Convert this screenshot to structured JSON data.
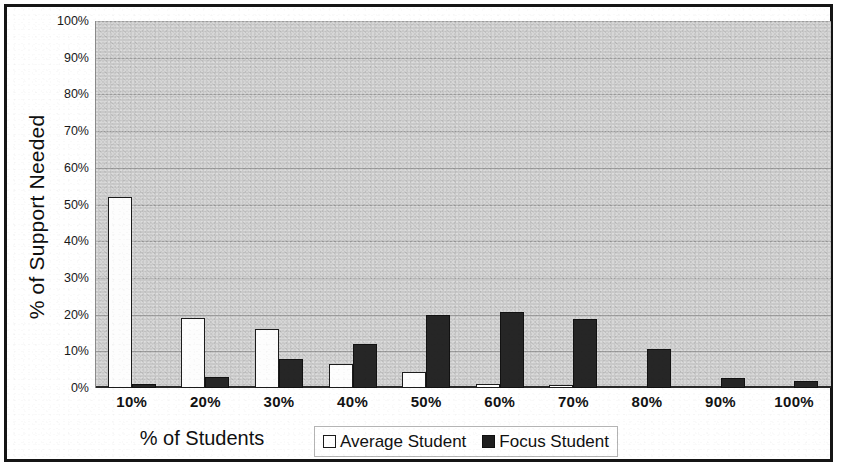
{
  "chart_data": {
    "type": "bar",
    "title": "",
    "xlabel": "% of Students",
    "ylabel": "% of Support Needed",
    "categories": [
      "10%",
      "20%",
      "30%",
      "40%",
      "50%",
      "60%",
      "70%",
      "80%",
      "90%",
      "100%"
    ],
    "series": [
      {
        "name": "Average Student",
        "color": "#ffffff",
        "values": [
          52,
          19,
          16,
          6.5,
          4.5,
          1,
          0.7,
          0,
          0,
          0
        ]
      },
      {
        "name": "Focus Student",
        "color": "#202020",
        "values": [
          1.2,
          3,
          7.8,
          12,
          19.8,
          20.7,
          18.8,
          10.5,
          2.8,
          1.8
        ]
      }
    ],
    "ylim": [
      0,
      100
    ],
    "ytick_labels": [
      "100%",
      "90%",
      "80%",
      "70%",
      "60%",
      "50%",
      "40%",
      "30%",
      "20%",
      "10%",
      "0%"
    ],
    "ytick_values": [
      100,
      90,
      80,
      70,
      60,
      50,
      40,
      30,
      20,
      10,
      0
    ],
    "grid": true,
    "legend_position": "bottom-center",
    "plot_background_color": "#c9c9c9",
    "frame_color": "#151515"
  },
  "legend": {
    "items": [
      {
        "label": "Average Student",
        "swatch": "hollow-square"
      },
      {
        "label": "Focus Student",
        "swatch": "filled-square"
      }
    ]
  }
}
